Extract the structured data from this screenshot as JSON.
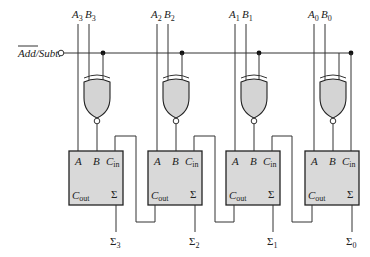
{
  "diagram": {
    "type": "4-bit parallel adder/subtractor",
    "control": {
      "label_overline": "Add",
      "label_rest": "/Subt.",
      "full_label": "Add/Subt."
    },
    "stages": [
      {
        "bit": 3,
        "a": "A",
        "a_sub": "3",
        "b": "B",
        "b_sub": "3",
        "sum": "Σ",
        "sum_sub": "3"
      },
      {
        "bit": 2,
        "a": "A",
        "a_sub": "2",
        "b": "B",
        "b_sub": "2",
        "sum": "Σ",
        "sum_sub": "2"
      },
      {
        "bit": 1,
        "a": "A",
        "a_sub": "1",
        "b": "B",
        "b_sub": "1",
        "sum": "Σ",
        "sum_sub": "1"
      },
      {
        "bit": 0,
        "a": "A",
        "a_sub": "0",
        "b": "B",
        "b_sub": "0",
        "sum": "Σ",
        "sum_sub": "0"
      }
    ],
    "adder_box": {
      "a_label": "A",
      "b_label": "B",
      "cin_label": "C",
      "cin_sub": "in",
      "cout_label": "C",
      "cout_sub": "out",
      "sum_label": "Σ"
    },
    "colors": {
      "box_fill": "#d9d9d9",
      "gate_fill": "#d4d4d4",
      "wire": "#333333"
    }
  }
}
